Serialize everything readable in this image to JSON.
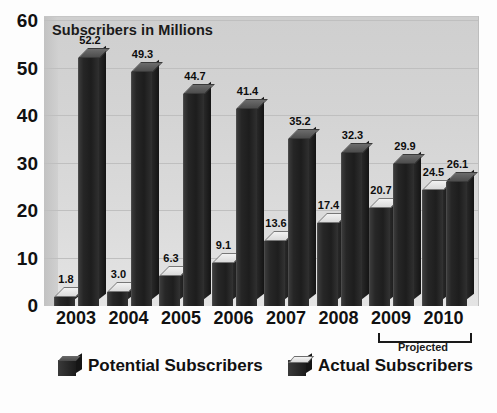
{
  "chart_data": {
    "type": "bar",
    "title": "Subscribers in Millions",
    "xlabel": "",
    "ylabel": "",
    "ylim": [
      0,
      60
    ],
    "yticks": [
      0,
      10,
      20,
      30,
      40,
      50,
      60
    ],
    "grid": true,
    "legend_position": "bottom",
    "categories": [
      "2003",
      "2004",
      "2005",
      "2006",
      "2007",
      "2008",
      "2009",
      "2010"
    ],
    "series": [
      {
        "name": "Actual Subscribers",
        "values": [
          1.8,
          3.0,
          6.3,
          9.1,
          13.6,
          17.4,
          20.7,
          24.5
        ],
        "labels": [
          "1.8",
          "3.0",
          "6.3",
          "9.1",
          "13.6",
          "17.4",
          "20.7",
          "24.5"
        ],
        "top_face_color": "#e8e8e8",
        "body_color": "#242424"
      },
      {
        "name": "Potential Subscribers",
        "values": [
          52.2,
          49.3,
          44.7,
          41.4,
          35.2,
          32.3,
          29.9,
          26.1
        ],
        "labels": [
          "52.2",
          "49.3",
          "44.7",
          "41.4",
          "35.2",
          "32.3",
          "29.9",
          "26.1"
        ],
        "top_face_color": "#585858",
        "body_color": "#1e1e1e"
      }
    ],
    "annotations": [
      {
        "name": "projected-bracket",
        "text": "Projected",
        "covers": [
          "2009",
          "2010"
        ]
      }
    ]
  },
  "legend": {
    "items": [
      {
        "label": "Potential Subscribers",
        "swatch": "dark-top-cube-icon"
      },
      {
        "label": "Actual Subscribers",
        "swatch": "light-top-cube-icon"
      }
    ]
  },
  "colors": {
    "plot_background": "#d6d6d6",
    "gridline": "#bfbfbf",
    "text": "#111111",
    "page_background": "#fdfdfd"
  }
}
